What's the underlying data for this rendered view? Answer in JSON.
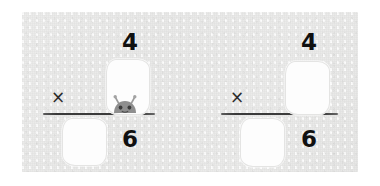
{
  "scene": {
    "title": "Fraction multiplication worksheet",
    "background_color": "#ffffff",
    "panel_color": "#eaeae9"
  },
  "problems": [
    {
      "id": "problem-left",
      "operator": "×",
      "left_factor": {
        "numerator_value": "",
        "numerator_is_blank": true,
        "denominator_value": "",
        "denominator_is_blank": true
      },
      "right_factor": {
        "numerator_value": "4",
        "numerator_is_blank": false,
        "denominator_value": "6",
        "denominator_is_blank": false
      },
      "blanks": [
        {
          "name": "blank-top-right",
          "filled": false
        },
        {
          "name": "blank-bottom-left",
          "filled": false
        }
      ],
      "numerator_shown": "4",
      "denominator_shown": "6",
      "character": {
        "name": "gray-creature",
        "visible": true,
        "body_color": "#8f8f8f",
        "antenna_color": "#9a9a9a",
        "eye_color": "#3c3c3c",
        "position": "peeking over fraction bar"
      }
    },
    {
      "id": "problem-right",
      "operator": "×",
      "left_factor": {
        "numerator_value": "",
        "numerator_is_blank": true,
        "denominator_value": "",
        "denominator_is_blank": true
      },
      "right_factor": {
        "numerator_value": "4",
        "numerator_is_blank": false,
        "denominator_value": "6",
        "denominator_is_blank": false
      },
      "blanks": [
        {
          "name": "blank-top-right",
          "filled": false
        },
        {
          "name": "blank-bottom-left",
          "filled": false
        }
      ],
      "numerator_shown": "4",
      "denominator_shown": "6",
      "character": {
        "name": "gray-creature",
        "visible": false,
        "body_color": "#8f8f8f",
        "antenna_color": "#9a9a9a",
        "eye_color": "#3c3c3c",
        "position": ""
      }
    }
  ]
}
